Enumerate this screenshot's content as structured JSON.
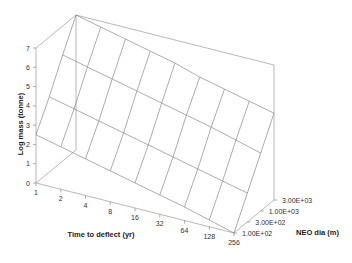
{
  "chart_data": {
    "type": "surface3d",
    "title": "",
    "xlabel": "Time to deflect (yr)",
    "ylabel": "Log mass (tonne)",
    "zlabel": "NEO dia (m)",
    "x_ticks": [
      "1",
      "2",
      "4",
      "8",
      "16",
      "32",
      "64",
      "128",
      "256"
    ],
    "z_ticks": [
      "1.00E+02",
      "3.00E+02",
      "1.00E+03",
      "3.00E+03"
    ],
    "y_ticks": [
      "0",
      "1",
      "2",
      "3",
      "4",
      "5",
      "6",
      "7"
    ],
    "ylim": [
      0,
      7
    ],
    "grid": false,
    "series": [
      {
        "name": "1.00E+02",
        "values": [
          2.5,
          2.2,
          1.9,
          1.6,
          1.3,
          1.0,
          0.7,
          0.35,
          0.0
        ]
      },
      {
        "name": "3.00E+02",
        "values": [
          3.9,
          3.6,
          3.3,
          3.0,
          2.7,
          2.4,
          2.1,
          1.8,
          1.5
        ]
      },
      {
        "name": "1.00E+03",
        "values": [
          5.5,
          5.2,
          4.9,
          4.6,
          4.3,
          4.0,
          3.7,
          3.35,
          3.0
        ]
      },
      {
        "name": "3.00E+03",
        "values": [
          7.0,
          6.7,
          6.4,
          6.1,
          5.8,
          5.4,
          5.1,
          4.8,
          4.5
        ]
      }
    ]
  }
}
